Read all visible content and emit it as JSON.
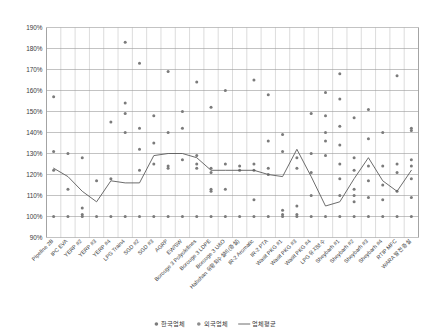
{
  "chart_data": {
    "type": "scatter",
    "title": "",
    "subtitle": "",
    "xlabel": "",
    "ylabel": "",
    "ylim": [
      90,
      190
    ],
    "ytick_labels": [
      "90%",
      "100%",
      "110%",
      "120%",
      "130%",
      "140%",
      "150%",
      "160%",
      "170%",
      "180%",
      "190%"
    ],
    "ytick_values": [
      90,
      100,
      110,
      120,
      130,
      140,
      150,
      160,
      170,
      180,
      190
    ],
    "grid": true,
    "legend_position": "bottom",
    "categories": [
      "Pipeline 2B",
      "IPC EVA",
      "YERP #2",
      "YERP #3",
      "YERP #4",
      "LPG Train4",
      "SGD #2",
      "SGD #3",
      "AGRP",
      "EW/SW",
      "Borouge 3 Polyolefines",
      "Borouge 3 LDPE",
      "Borouge 3 U&O",
      "Habshan 유황회수설비(증설)",
      "IR-2 Aromatic",
      "IR-2 PTA",
      "Wasit PKG #1",
      "Wasit PKG #3",
      "Wasit PKG #4",
      "LPG 유지보수",
      "Sheybarh #1",
      "Sheybarh #2",
      "Sheybarh #3",
      "Sheybarh #4",
      "RTIP MFC",
      "WARA 발전 증설"
    ],
    "series": [
      {
        "name": "한국업체",
        "color": "#7b7b7b",
        "marker": "circle",
        "points": [
          {
            "x": 0,
            "values": [
              100,
              122,
              131,
              157
            ]
          },
          {
            "x": 1,
            "values": [
              100,
              113,
              130
            ]
          },
          {
            "x": 2,
            "values": [
              100,
              101,
              104,
              128
            ]
          },
          {
            "x": 3,
            "values": [
              100,
              117
            ]
          },
          {
            "x": 4,
            "values": [
              100,
              118,
              145
            ]
          },
          {
            "x": 5,
            "values": [
              100,
              140,
              149,
              154,
              183
            ]
          },
          {
            "x": 6,
            "values": [
              100,
              122,
              132,
              142,
              173
            ]
          },
          {
            "x": 7,
            "values": [
              100,
              125,
              135,
              148
            ]
          },
          {
            "x": 8,
            "values": [
              100,
              123,
              124,
              140,
              169
            ]
          },
          {
            "x": 9,
            "values": [
              100,
              127,
              142,
              150
            ]
          },
          {
            "x": 10,
            "values": [
              100,
              123,
              125,
              129,
              164
            ]
          },
          {
            "x": 11,
            "values": [
              100,
              112,
              113,
              121,
              123,
              152
            ]
          },
          {
            "x": 12,
            "values": [
              100,
              113,
              125,
              160
            ]
          },
          {
            "x": 13,
            "values": [
              100,
              122,
              124
            ]
          },
          {
            "x": 14,
            "values": [
              100,
              108,
              122,
              125,
              165
            ]
          },
          {
            "x": 15,
            "values": [
              100,
              120,
              123,
              136,
              158
            ]
          },
          {
            "x": 16,
            "values": [
              100,
              101,
              103,
              131,
              139
            ]
          },
          {
            "x": 17,
            "values": [
              100,
              101,
              105,
              123,
              128
            ]
          },
          {
            "x": 18,
            "values": [
              100,
              110,
              121,
              130,
              149
            ]
          },
          {
            "x": 19,
            "values": [
              100,
              129,
              136,
              140,
              148,
              159
            ]
          },
          {
            "x": 20,
            "values": [
              100,
              110,
              118,
              125,
              134,
              143,
              156,
              168
            ]
          },
          {
            "x": 21,
            "values": [
              100,
              107,
              110,
              113,
              122,
              128,
              147
            ]
          },
          {
            "x": 22,
            "values": [
              100,
              109,
              117,
              124,
              137,
              151
            ]
          },
          {
            "x": 23,
            "values": [
              100,
              108,
              115,
              124,
              140
            ]
          },
          {
            "x": 24,
            "values": [
              100,
              112,
              121,
              125,
              167
            ]
          },
          {
            "x": 25,
            "values": [
              100,
              109,
              118,
              124,
              127,
              141,
              142
            ]
          }
        ]
      },
      {
        "name": "외국업체",
        "color": "#8d8d8d",
        "marker": "circle",
        "points": []
      }
    ],
    "average_series": {
      "name": "업체평균",
      "color": "#5b5b5b",
      "values": [
        123,
        119,
        112,
        107,
        117,
        116,
        116,
        129,
        130,
        130,
        128,
        122,
        122,
        122,
        122,
        120,
        119,
        132,
        119,
        105,
        107,
        118,
        128,
        117,
        112,
        122,
        119
      ]
    }
  },
  "legend": {
    "items": [
      {
        "label": "한국업체",
        "type": "marker",
        "color": "#7b7b7b"
      },
      {
        "label": "외국업체",
        "type": "marker",
        "color": "#8d8d8d"
      },
      {
        "label": "업체평균",
        "type": "line",
        "color": "#5b5b5b"
      }
    ]
  }
}
